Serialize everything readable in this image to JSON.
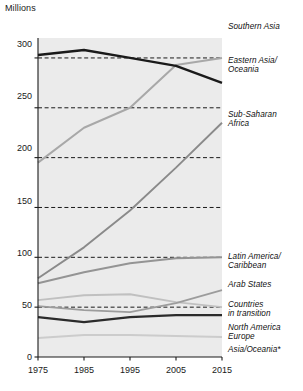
{
  "chart_data": {
    "type": "line",
    "title": "",
    "subtitle": "",
    "xlabel": "",
    "ylabel": "Millions",
    "unit_label": "Millions",
    "x": [
      1975,
      1985,
      1995,
      2005,
      2015
    ],
    "xticklabels": [
      "1975",
      "1985",
      "1995",
      "2005",
      "2015"
    ],
    "yticks": [
      0,
      50,
      100,
      150,
      200,
      250,
      300
    ],
    "yticklabels": [
      "0",
      "50",
      "100",
      "150",
      "200",
      "250",
      "300"
    ],
    "ylim": [
      0,
      320
    ],
    "xlim": [
      1975,
      2015
    ],
    "grid": "horizontal-dashed",
    "legend_position": "right-inline-labels",
    "plot_background": "#ebebeb",
    "series": [
      {
        "name": "Southern Asia",
        "label": "Southern Asia",
        "color": "#a8a8a8",
        "width": 2.0,
        "values": [
          195,
          230,
          250,
          293,
          300
        ]
      },
      {
        "name": "Eastern Asia/Oceania",
        "label": "Eastern Asia/\nOceania",
        "color": "#1a1a1a",
        "width": 2.4,
        "values": [
          303,
          308,
          300,
          292,
          275
        ]
      },
      {
        "name": "Sub-Saharan Africa",
        "label": "Sub-Saharan\nAfrica",
        "color": "#8a8a8a",
        "width": 1.9,
        "values": [
          79,
          110,
          147,
          190,
          235
        ]
      },
      {
        "name": "Latin America/Caribbean",
        "label": "Latin America/\nCaribbean",
        "color": "#949494",
        "width": 1.9,
        "values": [
          74,
          85,
          94,
          99,
          100
        ]
      },
      {
        "name": "Arab States",
        "label": "Arab States",
        "color": "#9c9c9c",
        "width": 1.9,
        "values": [
          51,
          47,
          45,
          54,
          67
        ]
      },
      {
        "name": "Countries in transition",
        "label": "Countries\nin transition",
        "color": "#c0c0c0",
        "width": 1.9,
        "values": [
          57,
          62,
          63,
          55,
          50
        ]
      },
      {
        "name": "North America/Europe",
        "label": "North America\nEurope",
        "color": "#2b2b2b",
        "width": 2.1,
        "values": [
          40,
          35,
          40,
          42,
          42
        ]
      },
      {
        "name": "Asia/Oceania*",
        "label": "Asia/Oceania*",
        "color": "#cccccc",
        "width": 1.9,
        "values": [
          19,
          22,
          22,
          21,
          20
        ]
      }
    ]
  },
  "labels": {
    "unit": "Millions",
    "southern_asia": "Southern Asia",
    "eastern_asia_oceania": "Eastern Asia/\nOceania",
    "sub_saharan_africa": "Sub-Saharan\nAfrica",
    "latin_america_caribbean": "Latin America/\nCaribbean",
    "arab_states": "Arab States",
    "countries_in_transition": "Countries\nin transition",
    "north_america_europe": "North America\nEurope",
    "asia_oceania": "Asia/Oceania*"
  },
  "yticks": {
    "t0": "0",
    "t50": "50",
    "t100": "100",
    "t150": "150",
    "t200": "200",
    "t250": "250",
    "t300": "300"
  },
  "xticks": {
    "t1975": "1975",
    "t1985": "1985",
    "t1995": "1995",
    "t2005": "2005",
    "t2015": "2015"
  }
}
